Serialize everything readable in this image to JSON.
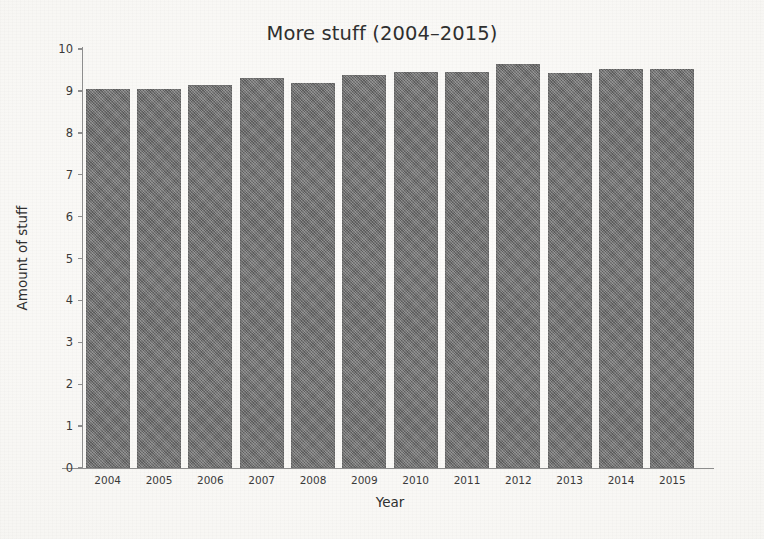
{
  "chart_data": {
    "type": "bar",
    "title": "More stuff (2004–2015)",
    "xlabel": "Year",
    "ylabel": "Amount of stuff",
    "categories": [
      "2004",
      "2005",
      "2006",
      "2007",
      "2008",
      "2009",
      "2010",
      "2011",
      "2012",
      "2013",
      "2014",
      "2015"
    ],
    "values": [
      9.05,
      9.05,
      9.15,
      9.3,
      9.2,
      9.38,
      9.45,
      9.45,
      9.65,
      9.43,
      9.52,
      9.52
    ],
    "ylim": [
      0,
      10
    ],
    "yticks": [
      0,
      1,
      2,
      3,
      4,
      5,
      6,
      7,
      8,
      9,
      10
    ],
    "ytick_labels": [
      "0",
      "1",
      "2",
      "3",
      "4",
      "5",
      "6",
      "7",
      "8",
      "9",
      "10"
    ],
    "xlim_categories": 12,
    "grid": false,
    "legend": null,
    "bar_color": "#6d6d6d",
    "background_color": "#faf9f7",
    "axis_color": "#8d8d8d",
    "text_color": "#2f2f2f"
  }
}
